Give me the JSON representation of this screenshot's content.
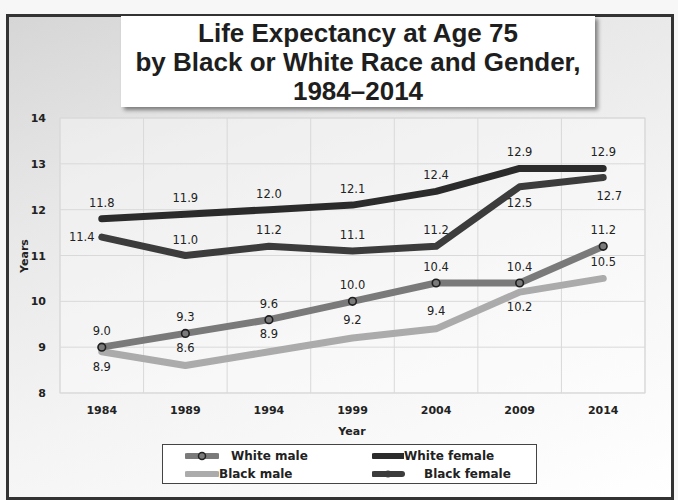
{
  "title": {
    "line1": "Life Expectancy at Age 75",
    "line2": "by Black or White Race and Gender,",
    "line3": "1984–2014"
  },
  "chart_data": {
    "type": "line",
    "title": "Life Expectancy at Age 75 by Black or White Race and Gender, 1984–2014",
    "xlabel": "Year",
    "ylabel": "Years",
    "categories": [
      "1984",
      "1989",
      "1994",
      "1999",
      "2004",
      "2009",
      "2014"
    ],
    "ylim": [
      8,
      14
    ],
    "yticks": [
      8,
      9,
      10,
      11,
      12,
      13,
      14
    ],
    "grid": true,
    "legend_position": "bottom",
    "series": [
      {
        "name": "White male",
        "color": "#7a7a7a",
        "marker": true,
        "values": [
          9.0,
          9.3,
          9.6,
          10.0,
          10.4,
          10.4,
          11.2
        ],
        "label_pos": "above"
      },
      {
        "name": "Black male",
        "color": "#ababab",
        "marker": false,
        "values": [
          8.9,
          8.6,
          8.9,
          9.2,
          9.4,
          10.2,
          10.5
        ],
        "label_pos": "below"
      },
      {
        "name": "White female",
        "color": "#2b2b2b",
        "marker": false,
        "values": [
          11.8,
          11.9,
          12.0,
          12.1,
          12.4,
          12.9,
          12.9
        ],
        "label_pos": "above"
      },
      {
        "name": "Black female",
        "color": "#3c3c3c",
        "marker": false,
        "values": [
          11.4,
          11.0,
          11.2,
          11.1,
          11.2,
          12.5,
          12.7
        ],
        "label_pos": "mixed"
      }
    ]
  },
  "legend": {
    "items": [
      {
        "label": "White male"
      },
      {
        "label": "White female"
      },
      {
        "label": "Black male"
      },
      {
        "label": "Black female"
      }
    ]
  }
}
